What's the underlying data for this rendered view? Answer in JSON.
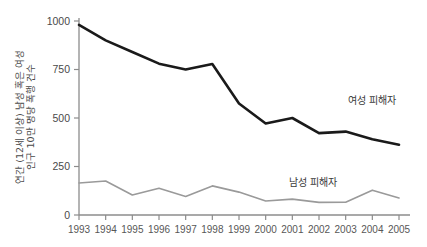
{
  "chart_data": {
    "type": "line",
    "title": "",
    "subtitle": "",
    "xlabel": "",
    "ylabel": "연간 (12세 이상) 남성 혹은 여성 인구 10만 명당 폭행 건수",
    "ylabel_line1": "연간 (12세 이상) 남성 혹은 여성",
    "ylabel_line2": "인구 10만 명당 폭행 건수",
    "x": [
      1993,
      1994,
      1995,
      1996,
      1997,
      1998,
      1999,
      2000,
      2001,
      2002,
      2003,
      2004,
      2005
    ],
    "xtick_labels": [
      "1993",
      "1994",
      "1995",
      "1996",
      "1997",
      "1998",
      "1999",
      "2000",
      "2001",
      "2002",
      "2003",
      "2004",
      "2005"
    ],
    "ytick_labels": [
      "0",
      "250",
      "500",
      "750",
      "1000"
    ],
    "yticks": [
      0,
      250,
      500,
      750,
      1000
    ],
    "ylim": [
      0,
      1000
    ],
    "xlim": [
      1993,
      2005
    ],
    "grid": false,
    "legend_position": "inline-annotation",
    "series": [
      {
        "name": "여성 피해자",
        "color": "#1a1a1a",
        "line_width": 2.6,
        "annotation_label": "여성 피해자",
        "values": [
          980,
          900,
          840,
          780,
          750,
          778,
          575,
          472,
          500,
          422,
          430,
          390,
          362
        ]
      },
      {
        "name": "남성 피해자",
        "color": "#9a9a9a",
        "line_width": 1.6,
        "annotation_label": "남성 피해자",
        "values": [
          165,
          175,
          103,
          138,
          95,
          150,
          118,
          72,
          82,
          65,
          66,
          128,
          88
        ]
      }
    ]
  },
  "colors": {
    "background": "#ffffff",
    "axis": "#8c8c8c",
    "female_series": "#1a1a1a",
    "male_series": "#9a9a9a",
    "tick_text": "#4a4a4a"
  },
  "annotations": {
    "female": {
      "label": "여성 피해자",
      "x": 372,
      "y": 104
    },
    "male": {
      "label": "남성 피해자",
      "x": 313,
      "y": 186
    }
  }
}
